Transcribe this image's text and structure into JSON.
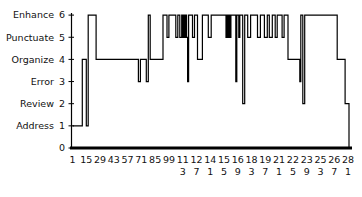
{
  "chart_data": {
    "type": "line",
    "subtype": "step",
    "title": "",
    "xlabel": "",
    "ylabel": "",
    "grid": false,
    "legend": null,
    "ylim": [
      0,
      6
    ],
    "xlim": [
      1,
      282
    ],
    "y_ticks": [
      0,
      1,
      2,
      3,
      4,
      5,
      6
    ],
    "y_tick_labels": [
      "",
      "Address",
      "Review",
      "Error",
      "Organize",
      "Punctuate",
      "Enhance"
    ],
    "y_tick_numbers": [
      "0",
      "1",
      "2",
      "3",
      "4",
      "5",
      "6"
    ],
    "x_ticks": [
      1,
      15,
      29,
      43,
      57,
      71,
      85,
      99,
      113,
      127,
      141,
      155,
      169,
      183,
      197,
      211,
      225,
      239,
      253,
      267,
      281
    ],
    "x_tick_labels": [
      "1",
      "15",
      "29",
      "43",
      "57",
      "71",
      "85",
      "99",
      "113",
      "127",
      "141",
      "155",
      "169",
      "183",
      "197",
      "211",
      "225",
      "239",
      "253",
      "267",
      "281"
    ],
    "x": [
      1,
      11,
      15,
      17,
      25,
      68,
      70,
      76,
      78,
      80,
      93,
      97,
      99,
      106,
      108,
      110,
      112,
      113,
      114,
      115,
      116,
      117,
      118,
      119,
      123,
      125,
      128,
      133,
      139,
      142,
      157,
      158,
      159,
      160,
      161,
      162,
      167,
      168,
      170,
      171,
      174,
      176,
      179,
      182,
      189,
      192,
      196,
      199,
      201,
      204,
      207,
      209,
      214,
      216,
      220,
      232,
      233,
      235,
      237,
      270,
      278,
      282
    ],
    "values": [
      1,
      4,
      1,
      6,
      4,
      3,
      4,
      3,
      6,
      4,
      6,
      5,
      6,
      5,
      6,
      5,
      6,
      5,
      6,
      5,
      6,
      5,
      3,
      6,
      5,
      6,
      4,
      6,
      5,
      6,
      5,
      6,
      5,
      6,
      5,
      6,
      3,
      6,
      5,
      6,
      2,
      6,
      5,
      6,
      5,
      6,
      5,
      6,
      5,
      6,
      5,
      6,
      5,
      6,
      4,
      3,
      6,
      2,
      6,
      4,
      2,
      0
    ],
    "line_color": "#000000"
  }
}
